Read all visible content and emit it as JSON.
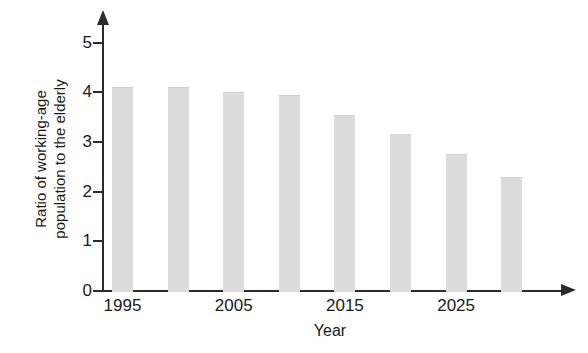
{
  "chart_data": {
    "type": "bar",
    "title": "",
    "xlabel": "Year",
    "ylabel": "Ratio of working-age\npopulation to the elderly",
    "categories": [
      1995,
      2000,
      2005,
      2010,
      2015,
      2020,
      2025,
      2030
    ],
    "values": [
      4.1,
      4.1,
      4.0,
      3.95,
      3.55,
      3.15,
      2.75,
      2.3
    ],
    "x_tick_labels": [
      "1995",
      "2005",
      "2015",
      "2025"
    ],
    "x_tick_values": [
      1995,
      2005,
      2015,
      2025
    ],
    "y_tick_labels": [
      "0",
      "1",
      "2",
      "3",
      "4",
      "5"
    ],
    "y_tick_values": [
      0,
      1,
      2,
      3,
      4,
      5
    ],
    "ylim": [
      0,
      5.4
    ],
    "xlim": [
      1992.5,
      2034
    ],
    "grid": false,
    "legend": false,
    "bar_color": "#dcdcdc",
    "axis_color": "#2b2b2b"
  },
  "axes": {
    "y_axis_title": "Ratio of working-age\npopulation to the elderly",
    "x_axis_title": "Year"
  }
}
